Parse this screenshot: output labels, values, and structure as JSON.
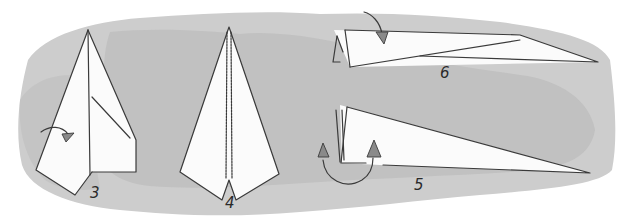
{
  "illustration": {
    "title": "Paper airplane folding steps",
    "background_wash_color": "#c9c9c9",
    "background_wash_dark": "#b8b8b8",
    "paper_color": "#fbfbfb",
    "line_color": "#3a3a3a",
    "arrow_fill": "#8a8a8a",
    "steps": [
      {
        "number": "3",
        "description": "Fold left side flap toward center (curved arrow)"
      },
      {
        "number": "4",
        "description": "Dart shape with both sides folded to the center crease"
      },
      {
        "number": "5",
        "description": "Fold in half; arrows show wings folding down"
      },
      {
        "number": "6",
        "description": "Fold wing down along edge (curved arrow)"
      }
    ]
  }
}
